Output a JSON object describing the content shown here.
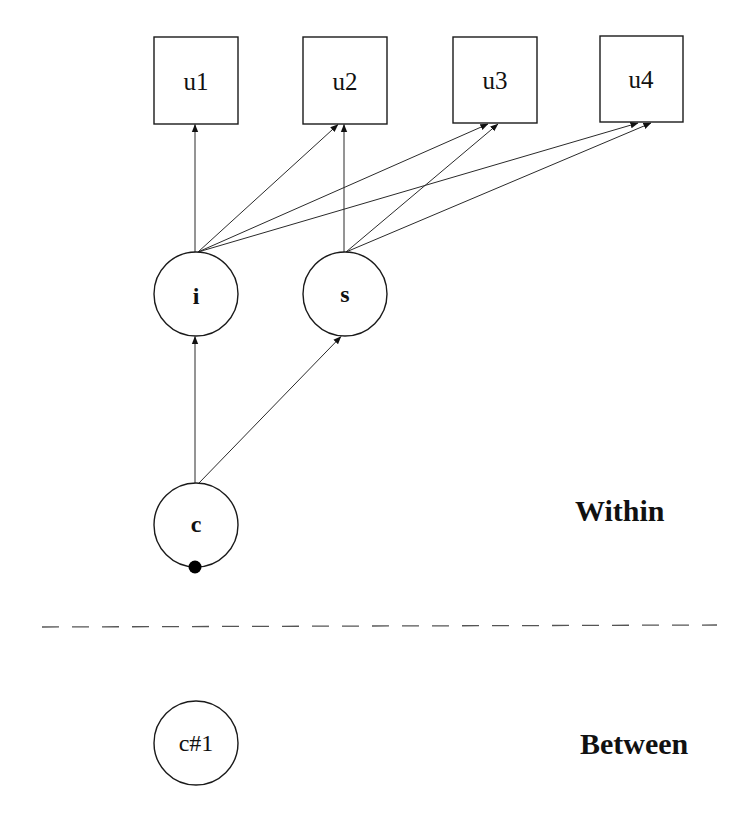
{
  "diagram": {
    "type": "path-diagram",
    "observed": [
      {
        "id": "u1",
        "label": "u1",
        "x": 154,
        "y": 37,
        "w": 84,
        "h": 87
      },
      {
        "id": "u2",
        "label": "u2",
        "x": 303,
        "y": 37,
        "w": 84,
        "h": 87
      },
      {
        "id": "u3",
        "label": "u3",
        "x": 453,
        "y": 37,
        "w": 84,
        "h": 86
      },
      {
        "id": "u4",
        "label": "u4",
        "x": 600,
        "y": 36,
        "w": 83,
        "h": 86
      }
    ],
    "latent": [
      {
        "id": "i",
        "label": "i",
        "cx": 196,
        "cy": 294,
        "r": 42
      },
      {
        "id": "s",
        "label": "s",
        "cx": 345,
        "cy": 294,
        "r": 42
      },
      {
        "id": "c",
        "label": "c",
        "cx": 196,
        "cy": 525,
        "r": 42,
        "random_intercept_dot": true
      }
    ],
    "between_nodes": [
      {
        "id": "c#1",
        "label": "c#1",
        "cx": 196,
        "cy": 743,
        "r": 42
      }
    ],
    "edges": [
      {
        "from": "i",
        "to": "u1"
      },
      {
        "from": "i",
        "to": "u2"
      },
      {
        "from": "i",
        "to": "u3"
      },
      {
        "from": "i",
        "to": "u4"
      },
      {
        "from": "s",
        "to": "u2"
      },
      {
        "from": "s",
        "to": "u3"
      },
      {
        "from": "s",
        "to": "u4"
      },
      {
        "from": "c",
        "to": "i"
      },
      {
        "from": "c",
        "to": "s"
      }
    ],
    "sections": {
      "within": "Within",
      "between": "Between"
    }
  }
}
